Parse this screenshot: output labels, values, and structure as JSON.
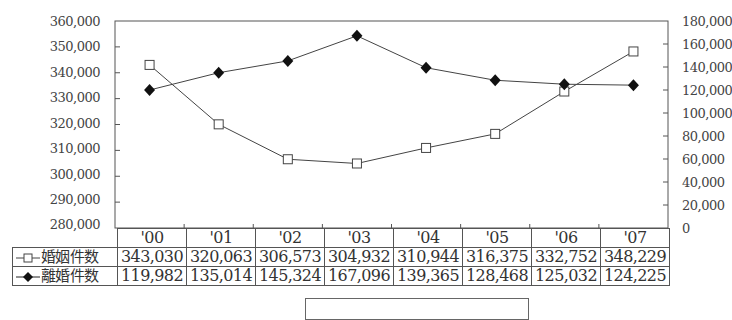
{
  "chart_data": {
    "type": "line",
    "title": "",
    "categories": [
      "'00",
      "'01",
      "'02",
      "'03",
      "'04",
      "'05",
      "'06",
      "'07"
    ],
    "series": [
      {
        "name": "婚姻件数",
        "axis": "left",
        "marker": "open-square",
        "values": [
          343030,
          320063,
          306573,
          304932,
          310944,
          316375,
          332752,
          348229
        ]
      },
      {
        "name": "離婚件数",
        "axis": "right",
        "marker": "filled-diamond",
        "values": [
          119982,
          135014,
          145324,
          167096,
          139365,
          128468,
          125032,
          124225
        ]
      }
    ],
    "y_left": {
      "range": [
        280000,
        360000
      ],
      "ticks": [
        "360,000",
        "350,000",
        "340,000",
        "330,000",
        "320,000",
        "310,000",
        "300,000",
        "290,000",
        "280,000"
      ]
    },
    "y_right": {
      "range": [
        0,
        180000
      ],
      "ticks": [
        "180,000",
        "160,000",
        "140,000",
        "120,000",
        "100,000",
        "80,000",
        "60,000",
        "40,000",
        "20,000",
        "0"
      ]
    },
    "grid": false,
    "legend_position": "data-table-left"
  },
  "table": {
    "headers": [
      "'00",
      "'01",
      "'02",
      "'03",
      "'04",
      "'05",
      "'06",
      "'07"
    ],
    "rows": [
      {
        "label": "婚姻件数",
        "values": [
          "343,030",
          "320,063",
          "306,573",
          "304,932",
          "310,944",
          "316,375",
          "332,752",
          "348,229"
        ]
      },
      {
        "label": "離婚件数",
        "values": [
          "119,982",
          "135,014",
          "145,324",
          "167,096",
          "139,365",
          "128,468",
          "125,032",
          "124,225"
        ]
      }
    ]
  }
}
